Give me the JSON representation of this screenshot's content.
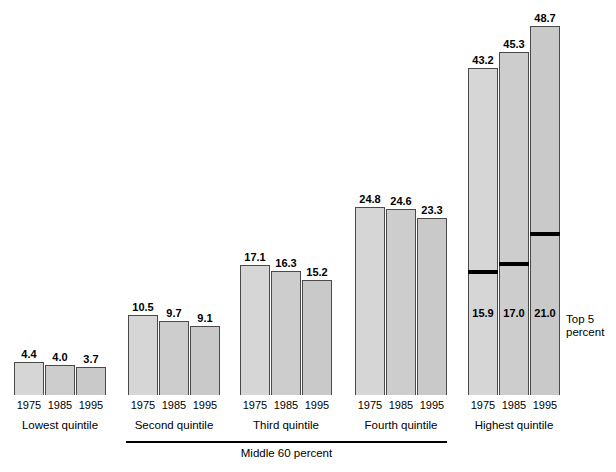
{
  "chart_data": {
    "type": "bar",
    "title": "",
    "subtitle": "",
    "xlabel": "",
    "ylabel": "",
    "ylim": [
      0,
      50
    ],
    "grid": false,
    "legend": null,
    "categories": [
      "1975",
      "1985",
      "1995"
    ],
    "groups": [
      {
        "name": "Lowest quintile",
        "label": "Lowest quintile",
        "values": [
          4.4,
          4.0,
          3.7
        ],
        "value_labels": [
          "4.4",
          "4.0",
          "3.7"
        ]
      },
      {
        "name": "Second quintile",
        "label": "Second quintile",
        "values": [
          10.5,
          9.7,
          9.1
        ],
        "value_labels": [
          "10.5",
          "9.7",
          "9.1"
        ]
      },
      {
        "name": "Third quintile",
        "label": "Third quintile",
        "values": [
          17.1,
          16.3,
          15.2
        ],
        "value_labels": [
          "17.1",
          "16.3",
          "15.2"
        ]
      },
      {
        "name": "Fourth quintile",
        "label": "Fourth quintile",
        "values": [
          24.8,
          24.6,
          23.3
        ],
        "value_labels": [
          "24.8",
          "24.6",
          "23.3"
        ]
      },
      {
        "name": "Highest quintile",
        "label": "Highest quintile",
        "values": [
          43.2,
          45.3,
          48.7
        ],
        "value_labels": [
          "43.2",
          "45.3",
          "48.7"
        ],
        "inner_segment": {
          "name": "Top 5 percent",
          "label_line1": "Top 5",
          "label_line2": "percent",
          "values": [
            15.9,
            17.0,
            21.0
          ],
          "value_labels": [
            "15.9",
            "17.0",
            "21.0"
          ]
        }
      }
    ],
    "annotations": [
      {
        "name": "middle-60-percent-bracket",
        "text": "Middle 60 percent",
        "spans": [
          "Second quintile",
          "Third quintile",
          "Fourth quintile"
        ]
      },
      {
        "name": "top-5-percent-callout",
        "text": "Top 5 percent"
      }
    ],
    "colors": {
      "bar_fill_1": "#d6d6d6",
      "bar_fill_2": "#cdcdcd",
      "bar_fill_3": "#c9c9c9",
      "bar_stroke": "#4a4a4a",
      "divider": "#000000",
      "text": "#000000",
      "background": "#ffffff"
    }
  },
  "layout": {
    "baseline_y": 395,
    "px_per_unit": 7.58,
    "group_x": [
      14,
      128,
      240,
      355,
      468
    ],
    "bar_width": 30,
    "bar_gap": 1
  }
}
